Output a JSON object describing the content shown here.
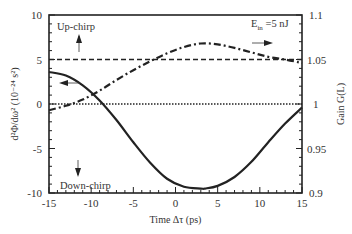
{
  "chart_data": {
    "type": "line",
    "title": "",
    "annotation": "E_in =5 nJ",
    "xlabel": "Time Δτ (ps)",
    "ylabel_left": "d²Φ/dω² (10⁻²⁴ s²)",
    "ylabel_right": "Gain G(L)",
    "xlim": [
      -15,
      15
    ],
    "ylim_left": [
      -10,
      10
    ],
    "ylim_right": [
      0.9,
      1.1
    ],
    "x_ticks": [
      "-15",
      "-10",
      "-5",
      "0",
      "5",
      "10",
      "15"
    ],
    "y_ticks_left": [
      "10",
      "5",
      "0",
      "-5",
      "-10"
    ],
    "y_ticks_right": [
      "1.1",
      "1.05",
      "1",
      "0.95",
      "0.9"
    ],
    "labels": {
      "up_chirp": "Up-chirp",
      "down_chirp": "Down-chirp",
      "ein_main": "E",
      "ein_sub": "in",
      "ein_value": " =5 nJ"
    },
    "grid": false,
    "series": [
      {
        "name": "Chirp d²Φ/dω² (solid, left axis)",
        "axis": "left",
        "style": "solid",
        "x": [
          -15,
          -13,
          -11,
          -9,
          -7,
          -5,
          -3,
          -1,
          1,
          3,
          3.5,
          5,
          7,
          9,
          11,
          13,
          15
        ],
        "values": [
          3.6,
          3.2,
          2.1,
          0.4,
          -1.8,
          -4.3,
          -6.6,
          -8.4,
          -9.3,
          -9.5,
          -9.5,
          -9.2,
          -8.2,
          -6.5,
          -4.3,
          -2.2,
          -0.4
        ]
      },
      {
        "name": "Gain G(L) (dash-dot, right axis)",
        "axis": "right",
        "style": "dash-dot",
        "x": [
          -15,
          -13,
          -11,
          -9,
          -7,
          -5,
          -3,
          -1,
          1,
          3,
          5,
          7,
          9,
          11,
          13,
          15
        ],
        "values": [
          0.993,
          0.998,
          1.005,
          1.015,
          1.027,
          1.038,
          1.048,
          1.057,
          1.064,
          1.068,
          1.067,
          1.063,
          1.058,
          1.053,
          1.05,
          1.046
        ]
      },
      {
        "name": "Reference gain 1.05 (dashed)",
        "axis": "right",
        "style": "dashed",
        "x": [
          -15,
          15
        ],
        "values": [
          1.05,
          1.05
        ]
      },
      {
        "name": "Reference zero / gain 1 (dotted)",
        "axis": "left",
        "style": "dotted",
        "x": [
          -15,
          15
        ],
        "values": [
          0,
          0
        ]
      }
    ],
    "arrows": [
      {
        "direction": "up",
        "near": "Up-chirp"
      },
      {
        "direction": "down",
        "near": "Down-chirp"
      },
      {
        "direction": "left",
        "meaning": "solid curve uses left axis"
      },
      {
        "direction": "right",
        "meaning": "dash-dot curve uses right axis"
      }
    ]
  }
}
